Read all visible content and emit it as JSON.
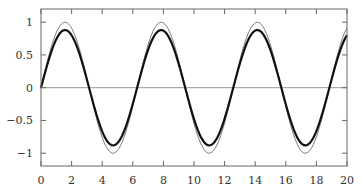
{
  "chart_data": {
    "type": "line",
    "title": "",
    "xlabel": "",
    "ylabel": "",
    "xlim": [
      0,
      20
    ],
    "ylim": [
      -1.2,
      1.2
    ],
    "grid": false,
    "legend": null,
    "x_ticks": [
      0,
      2,
      4,
      6,
      8,
      10,
      12,
      14,
      16,
      18,
      20
    ],
    "x_tick_labels": [
      "0",
      "2",
      "4",
      "6",
      "8",
      "10",
      "12",
      "14",
      "16",
      "18",
      "20"
    ],
    "y_ticks": [
      1,
      0.5,
      0,
      -0.5,
      -1
    ],
    "y_tick_labels": [
      "1",
      "0.5",
      "0",
      "−0.5",
      "−1"
    ],
    "zero_line": {
      "y": 0,
      "color": "#999999"
    },
    "series": [
      {
        "name": "sin(x)",
        "style": "thin",
        "color": "#555555",
        "amplitude": 1.0,
        "description": "thin line, y = sin(x)"
      },
      {
        "name": "0.88 sin(x)",
        "style": "thick",
        "color": "#111111",
        "amplitude": 0.88,
        "description": "thick line, damped amplitude ~0.88"
      }
    ],
    "sample_points": {
      "x": [
        0,
        1.57,
        3.14,
        4.71,
        6.28,
        7.85,
        9.42,
        11.0,
        12.57,
        14.14,
        15.71,
        17.28,
        18.85,
        20
      ],
      "thin": [
        0,
        1,
        0,
        -1,
        0,
        1,
        0,
        -1,
        0,
        1,
        0,
        -1,
        0,
        0.913
      ],
      "thick": [
        0,
        0.88,
        0,
        -0.88,
        0,
        0.88,
        0,
        -0.88,
        0,
        0.88,
        0,
        -0.88,
        0,
        0.8
      ]
    }
  }
}
